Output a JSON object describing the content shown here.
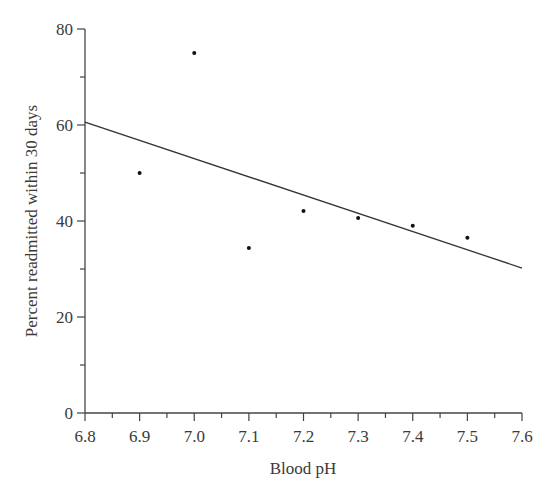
{
  "chart_data": {
    "type": "scatter",
    "title": "",
    "xlabel": "Blood pH",
    "ylabel": "Percent readmitted within 30 days",
    "xlim": [
      6.8,
      7.6
    ],
    "ylim": [
      0,
      80
    ],
    "x_ticks": [
      "6.8",
      "6.9",
      "7.0",
      "7.1",
      "7.2",
      "7.3",
      "7.4",
      "7.5",
      "7.6"
    ],
    "y_ticks": [
      "0",
      "20",
      "40",
      "60",
      "80"
    ],
    "grid": false,
    "legend": null,
    "series": [
      {
        "name": "Observed",
        "kind": "scatter",
        "x": [
          6.9,
          7.0,
          7.1,
          7.2,
          7.3,
          7.4,
          7.5
        ],
        "y": [
          50,
          75,
          34.4,
          42.1,
          40.6,
          39.0,
          36.5
        ]
      },
      {
        "name": "Linear fit",
        "kind": "line",
        "x": [
          6.8,
          7.6
        ],
        "y": [
          60.6,
          30.2
        ]
      }
    ]
  }
}
